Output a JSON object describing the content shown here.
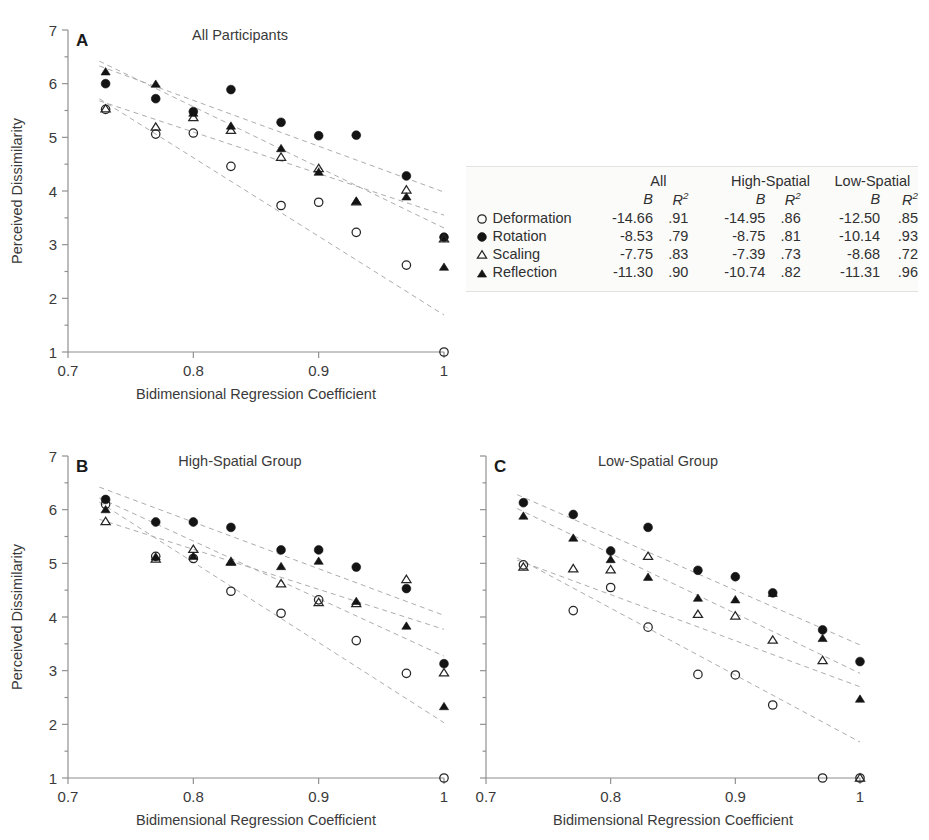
{
  "figure": {
    "axis_x_title": "Bidimensional Regression Coefficient",
    "axis_y_title": "Perceived Dissimilarity",
    "x_tick_labels": [
      "0.7",
      "0.8",
      "0.9",
      "1"
    ],
    "y_tick_labels": [
      "1",
      "2",
      "3",
      "4",
      "5",
      "6",
      "7"
    ],
    "panel_a_letter": "A",
    "panel_b_letter": "B",
    "panel_c_letter": "C",
    "panel_a_title": "All Participants",
    "panel_b_title": "High-Spatial Group",
    "panel_c_title": "Low-Spatial Group"
  },
  "legend": {
    "group_headers": [
      "All",
      "High-Spatial",
      "Low-Spatial"
    ],
    "stat_b": "B",
    "stat_r2_base": "R",
    "stat_r2_exp": "2",
    "rows": [
      {
        "symbol": "open-circle",
        "label": "Deformation",
        "all_b": "-14.66",
        "all_r2": ".91",
        "high_b": "-14.95",
        "high_r2": ".86",
        "low_b": "-12.50",
        "low_r2": ".85"
      },
      {
        "symbol": "filled-circle",
        "label": "Rotation",
        "all_b": "-8.53",
        "all_r2": ".79",
        "high_b": "-8.75",
        "high_r2": ".81",
        "low_b": "-10.14",
        "low_r2": ".93"
      },
      {
        "symbol": "open-triangle",
        "label": "Scaling",
        "all_b": "-7.75",
        "all_r2": ".83",
        "high_b": "-7.39",
        "high_r2": ".73",
        "low_b": "-8.68",
        "low_r2": ".72"
      },
      {
        "symbol": "filled-triangle",
        "label": "Reflection",
        "all_b": "-11.30",
        "all_r2": ".90",
        "high_b": "-10.74",
        "high_r2": ".82",
        "low_b": "-11.31",
        "low_r2": ".96"
      }
    ]
  },
  "chart_data": [
    {
      "type": "scatter",
      "panel": "A",
      "title": "All Participants",
      "xlabel": "Bidimensional Regression Coefficient",
      "ylabel": "Perceived Dissimilarity",
      "xlim": [
        0.7,
        1.0
      ],
      "ylim": [
        1,
        7
      ],
      "xticks": [
        0.7,
        0.8,
        0.9,
        1.0
      ],
      "yticks": [
        1,
        2,
        3,
        4,
        5,
        6,
        7
      ],
      "grid": false,
      "legend_position": "external-right",
      "x": [
        0.73,
        0.77,
        0.8,
        0.83,
        0.87,
        0.9,
        0.93,
        0.97,
        1.0
      ],
      "series": [
        {
          "name": "Deformation",
          "marker": "open-circle",
          "values": [
            5.52,
            5.06,
            5.08,
            4.46,
            3.73,
            3.79,
            3.23,
            2.62,
            1.0
          ],
          "fit_slope": -14.66,
          "fit_r2": 0.91,
          "fit_endpoints": [
            [
              0.725,
              5.72
            ],
            [
              1.0,
              1.69
            ]
          ]
        },
        {
          "name": "Rotation",
          "marker": "filled-circle",
          "values": [
            6.0,
            5.72,
            5.48,
            5.89,
            5.28,
            5.03,
            5.04,
            4.28,
            3.14
          ],
          "fit_slope": -8.53,
          "fit_r2": 0.79,
          "fit_endpoints": [
            [
              0.725,
              6.33
            ],
            [
              1.0,
              3.98
            ]
          ]
        },
        {
          "name": "Scaling",
          "marker": "open-triangle",
          "values": [
            5.53,
            5.19,
            5.37,
            5.13,
            4.63,
            4.42,
            3.8,
            4.02,
            3.11
          ],
          "fit_slope": -7.75,
          "fit_r2": 0.83,
          "fit_endpoints": [
            [
              0.725,
              5.68
            ],
            [
              1.0,
              3.55
            ]
          ]
        },
        {
          "name": "Reflection",
          "marker": "filled-triangle",
          "values": [
            6.22,
            5.99,
            5.45,
            5.21,
            4.79,
            4.35,
            3.81,
            3.89,
            2.58
          ],
          "fit_slope": -11.3,
          "fit_r2": 0.9,
          "fit_endpoints": [
            [
              0.725,
              6.42
            ],
            [
              1.0,
              3.31
            ]
          ]
        }
      ]
    },
    {
      "type": "scatter",
      "panel": "B",
      "title": "High-Spatial Group",
      "xlabel": "Bidimensional Regression Coefficient",
      "ylabel": "Perceived Dissimilarity",
      "xlim": [
        0.7,
        1.0
      ],
      "ylim": [
        1,
        7
      ],
      "xticks": [
        0.7,
        0.8,
        0.9,
        1.0
      ],
      "yticks": [
        1,
        2,
        3,
        4,
        5,
        6,
        7
      ],
      "grid": false,
      "legend_position": "none",
      "x": [
        0.73,
        0.77,
        0.8,
        0.83,
        0.87,
        0.9,
        0.93,
        0.97,
        1.0
      ],
      "values_note": "read from panel B",
      "series": [
        {
          "name": "Deformation",
          "marker": "open-circle",
          "values": [
            6.1,
            5.13,
            5.09,
            4.48,
            4.07,
            4.32,
            3.56,
            2.95,
            1.0
          ],
          "fit_slope": -14.95,
          "fit_r2": 0.86,
          "fit_endpoints": [
            [
              0.725,
              6.14
            ],
            [
              1.0,
              2.03
            ]
          ]
        },
        {
          "name": "Rotation",
          "marker": "filled-circle",
          "values": [
            6.19,
            5.77,
            5.77,
            5.67,
            5.25,
            5.25,
            4.93,
            4.53,
            3.13
          ],
          "fit_slope": -8.75,
          "fit_r2": 0.81,
          "fit_endpoints": [
            [
              0.725,
              6.42
            ],
            [
              1.0,
              4.03
            ]
          ]
        },
        {
          "name": "Scaling",
          "marker": "open-triangle",
          "values": [
            5.78,
            5.08,
            5.26,
            5.03,
            4.62,
            4.27,
            4.25,
            4.7,
            2.96
          ],
          "fit_slope": -7.39,
          "fit_r2": 0.73,
          "fit_endpoints": [
            [
              0.725,
              5.82
            ],
            [
              1.0,
              3.77
            ]
          ]
        },
        {
          "name": "Reflection",
          "marker": "filled-triangle",
          "values": [
            6.0,
            5.12,
            5.13,
            5.02,
            4.94,
            5.04,
            4.29,
            3.83,
            2.33
          ],
          "fit_slope": -10.74,
          "fit_r2": 0.82,
          "fit_endpoints": [
            [
              0.725,
              6.22
            ],
            [
              1.0,
              3.27
            ]
          ]
        }
      ]
    },
    {
      "type": "scatter",
      "panel": "C",
      "title": "Low-Spatial Group",
      "xlabel": "Bidimensional Regression Coefficient",
      "ylabel": "Perceived Dissimilarity",
      "xlim": [
        0.7,
        1.0
      ],
      "ylim": [
        1,
        7
      ],
      "xticks": [
        0.7,
        0.8,
        0.9,
        1.0
      ],
      "yticks": [
        1,
        2,
        3,
        4,
        5,
        6,
        7
      ],
      "grid": false,
      "legend_position": "none",
      "x": [
        0.73,
        0.77,
        0.8,
        0.83,
        0.87,
        0.9,
        0.93,
        0.97,
        1.0
      ],
      "series": [
        {
          "name": "Deformation",
          "marker": "open-circle",
          "values": [
            4.97,
            4.12,
            4.55,
            3.81,
            2.93,
            2.92,
            2.36,
            1.0,
            1.0
          ],
          "fit_slope": -12.5,
          "fit_r2": 0.85,
          "fit_endpoints": [
            [
              0.725,
              5.1
            ],
            [
              1.0,
              1.67
            ]
          ]
        },
        {
          "name": "Rotation",
          "marker": "filled-circle",
          "values": [
            6.13,
            5.91,
            5.23,
            5.67,
            4.87,
            4.75,
            4.45,
            3.76,
            3.17
          ],
          "fit_slope": -10.14,
          "fit_r2": 0.93,
          "fit_endpoints": [
            [
              0.725,
              6.28
            ],
            [
              1.0,
              3.48
            ]
          ]
        },
        {
          "name": "Scaling",
          "marker": "open-triangle",
          "values": [
            4.93,
            4.9,
            4.88,
            5.13,
            4.05,
            4.02,
            3.57,
            3.19,
            1.0
          ],
          "fit_slope": -8.68,
          "fit_r2": 0.72,
          "fit_endpoints": [
            [
              0.725,
              5.06
            ],
            [
              1.0,
              2.7
            ]
          ]
        },
        {
          "name": "Reflection",
          "marker": "filled-triangle",
          "values": [
            5.88,
            5.47,
            5.07,
            4.74,
            4.35,
            4.32,
            4.44,
            3.6,
            2.47
          ],
          "fit_slope": -11.31,
          "fit_r2": 0.96,
          "fit_endpoints": [
            [
              0.725,
              6.02
            ],
            [
              1.0,
              2.95
            ]
          ]
        }
      ]
    }
  ]
}
